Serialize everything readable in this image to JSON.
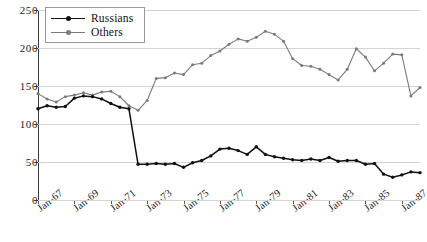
{
  "chart_data": {
    "type": "line",
    "title": "",
    "xlabel": "",
    "ylabel": "",
    "ylim": [
      0,
      250
    ],
    "yticks": [
      0,
      50,
      100,
      150,
      200,
      250
    ],
    "grid": true,
    "legend_position": "top-left",
    "x_tick_labels": [
      "Jan-67",
      "Jan-69",
      "Jan-71",
      "Jan-73",
      "Jan-75",
      "Jan-77",
      "Jan-79",
      "Jan-81",
      "Jan-83",
      "Jan-85",
      "Jan-87"
    ],
    "x_tick_values": [
      1967,
      1969,
      1971,
      1973,
      1975,
      1977,
      1979,
      1981,
      1983,
      1985,
      1987
    ],
    "x": [
      1967.0,
      1967.5,
      1968.0,
      1968.5,
      1969.0,
      1969.5,
      1970.0,
      1970.5,
      1971.0,
      1971.5,
      1972.0,
      1972.5,
      1973.0,
      1973.5,
      1974.0,
      1974.5,
      1975.0,
      1975.5,
      1976.0,
      1976.5,
      1977.0,
      1977.5,
      1978.0,
      1978.5,
      1979.0,
      1979.5,
      1980.0,
      1980.5,
      1981.0,
      1981.5,
      1982.0,
      1982.5,
      1983.0,
      1983.5,
      1984.0,
      1984.5,
      1985.0,
      1985.5,
      1986.0,
      1986.5,
      1987.0,
      1987.5,
      1988.0
    ],
    "series": [
      {
        "name": "Russians",
        "color": "#111111",
        "marker": "circle",
        "values": [
          120,
          124,
          122,
          123,
          134,
          137,
          136,
          133,
          127,
          122,
          120,
          47,
          47,
          48,
          47,
          48,
          43,
          49,
          52,
          58,
          67,
          68,
          65,
          60,
          70,
          60,
          57,
          55,
          53,
          52,
          54,
          52,
          56,
          51,
          52,
          52,
          47,
          48,
          34,
          30,
          33,
          37,
          36
        ]
      },
      {
        "name": "Others",
        "color": "#7a7a7a",
        "marker": "circle",
        "values": [
          140,
          133,
          129,
          136,
          138,
          141,
          138,
          142,
          143,
          136,
          124,
          118,
          131,
          160,
          161,
          167,
          165,
          178,
          180,
          190,
          196,
          205,
          212,
          209,
          214,
          222,
          218,
          209,
          186,
          177,
          176,
          172,
          165,
          158,
          172,
          199,
          188,
          170,
          180,
          192,
          191,
          137,
          148
        ]
      }
    ]
  },
  "legend": {
    "items": [
      {
        "label": "Russians"
      },
      {
        "label": "Others"
      }
    ]
  }
}
